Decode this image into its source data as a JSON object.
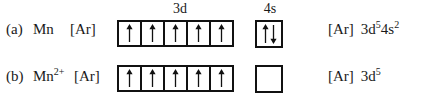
{
  "figure": {
    "background_color": "#ffffff",
    "line_color": "#111111",
    "text_color": "#1a1a1a"
  },
  "orbital_labels": {
    "d_label": "3d",
    "s_label": "4s"
  },
  "rows": [
    {
      "marker": "(a)",
      "species": "Mn",
      "species_charge": "",
      "core": "[Ar]",
      "d_boxes": [
        "up",
        "up",
        "up",
        "up",
        "up"
      ],
      "s_box": "up-down",
      "config_core": "[Ar]",
      "config_terms": [
        {
          "orbital": "3d",
          "count": "5"
        },
        {
          "orbital": "4s",
          "count": "2"
        }
      ]
    },
    {
      "marker": "(b)",
      "species": "Mn",
      "species_charge": "2+",
      "core": "[Ar]",
      "d_boxes": [
        "up",
        "up",
        "up",
        "up",
        "up"
      ],
      "s_box": "empty",
      "config_core": "[Ar]",
      "config_terms": [
        {
          "orbital": "3d",
          "count": "5"
        }
      ]
    }
  ]
}
